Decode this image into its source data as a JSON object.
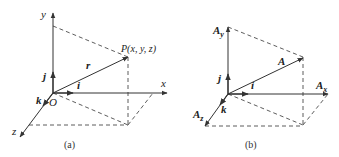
{
  "figure": {
    "panels": [
      {
        "id": "a",
        "caption": "(a)",
        "labels": {
          "y_axis": "y",
          "x_axis": "x",
          "z_axis": "z",
          "origin": "O",
          "point": "P(x, y, z)",
          "position_vector": "r",
          "unit_i": "i",
          "unit_j": "j",
          "unit_k": "k"
        }
      },
      {
        "id": "b",
        "caption": "(b)",
        "labels": {
          "component_y": "A",
          "component_y_sub": "y",
          "component_x": "A",
          "component_x_sub": "x",
          "component_z": "A",
          "component_z_sub": "z",
          "vector": "A",
          "unit_i": "i",
          "unit_j": "j",
          "unit_k": "k"
        }
      }
    ],
    "colors": {
      "line": "#333333",
      "background": "#ffffff"
    }
  }
}
